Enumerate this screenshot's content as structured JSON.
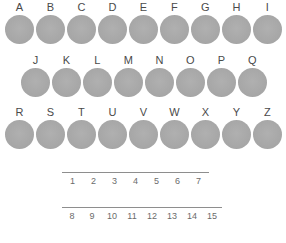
{
  "page": {
    "background_color": "#ffffff",
    "circle_color": "#a9a9a9",
    "letter_color": "#4a4a4a",
    "number_color": "#6b6b6b",
    "line_color": "#8e8e8e"
  },
  "letter_rows": [
    {
      "row_id": "row-1",
      "letters": [
        "A",
        "B",
        "C",
        "D",
        "E",
        "F",
        "G",
        "H",
        "I"
      ]
    },
    {
      "row_id": "row-2",
      "letters": [
        "J",
        "K",
        "L",
        "M",
        "N",
        "O",
        "P",
        "Q"
      ]
    },
    {
      "row_id": "row-3",
      "letters": [
        "R",
        "S",
        "T",
        "U",
        "V",
        "W",
        "X",
        "Y",
        "Z"
      ]
    }
  ],
  "blank_rows": [
    {
      "row_id": "blank-row-1",
      "numbers": [
        "1",
        "2",
        "3",
        "4",
        "5",
        "6",
        "7"
      ]
    },
    {
      "row_id": "blank-row-2",
      "numbers": [
        "8",
        "9",
        "10",
        "11",
        "12",
        "13",
        "14",
        "15"
      ]
    }
  ]
}
